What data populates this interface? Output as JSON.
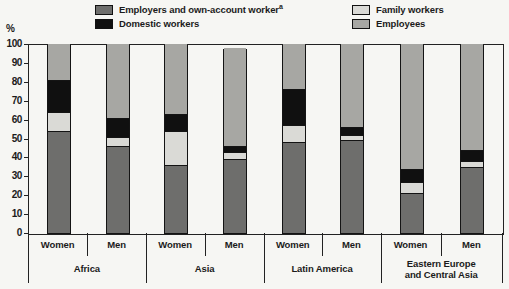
{
  "axis_unit_label": "%",
  "legend": {
    "items": [
      {
        "key": "employers_own_account",
        "label": "Employers and own-account worker",
        "footnote_marker": "a",
        "color": "#6e6e6c"
      },
      {
        "key": "domestic_workers",
        "label": "Domestic workers",
        "footnote_marker": "",
        "color": "#101010"
      },
      {
        "key": "family_workers",
        "label": "Family workers",
        "footnote_marker": "",
        "color": "#dadad6"
      },
      {
        "key": "employees",
        "label": "Employees",
        "footnote_marker": "",
        "color": "#a7a7a3"
      }
    ]
  },
  "chart_data": {
    "type": "bar",
    "stacked": true,
    "orientation": "vertical",
    "title": "",
    "ylabel": "%",
    "ylim": [
      0,
      100
    ],
    "yticks": [
      0,
      10,
      20,
      30,
      40,
      50,
      60,
      70,
      80,
      90,
      100
    ],
    "grid": false,
    "legend_position": "top",
    "stack_order_bottom_to_top": [
      "employers_own_account",
      "family_workers",
      "domestic_workers",
      "employees"
    ],
    "series_colors": {
      "employers_own_account": "#6e6e6c",
      "family_workers": "#dadad6",
      "domestic_workers": "#101010",
      "employees": "#a7a7a3"
    },
    "groups": [
      {
        "label": "Africa",
        "bars": [
          {
            "label": "Women",
            "values": {
              "employers_own_account": 54,
              "family_workers": 10,
              "domestic_workers": 17,
              "employees": 19
            }
          },
          {
            "label": "Men",
            "values": {
              "employers_own_account": 46,
              "family_workers": 5,
              "domestic_workers": 10,
              "employees": 39
            }
          }
        ]
      },
      {
        "label": "Asia",
        "bars": [
          {
            "label": "Women",
            "values": {
              "employers_own_account": 36,
              "family_workers": 18,
              "domestic_workers": 9,
              "employees": 37
            }
          },
          {
            "label": "Men",
            "values": {
              "employers_own_account": 39,
              "family_workers": 4,
              "domestic_workers": 3,
              "employees": 52
            }
          }
        ]
      },
      {
        "label": "Latin America",
        "bars": [
          {
            "label": "Women",
            "values": {
              "employers_own_account": 48,
              "family_workers": 9,
              "domestic_workers": 19,
              "employees": 24
            }
          },
          {
            "label": "Men",
            "values": {
              "employers_own_account": 49,
              "family_workers": 3,
              "domestic_workers": 4,
              "employees": 44
            }
          }
        ]
      },
      {
        "label": "Eastern Europe\nand Central Asia",
        "bars": [
          {
            "label": "Women",
            "values": {
              "employers_own_account": 21,
              "family_workers": 6,
              "domestic_workers": 7,
              "employees": 66
            }
          },
          {
            "label": "Men",
            "values": {
              "employers_own_account": 35,
              "family_workers": 3,
              "domestic_workers": 6,
              "employees": 56
            }
          }
        ]
      }
    ]
  },
  "colors": {
    "ink": "#222222",
    "background": "#f6f6f3"
  }
}
